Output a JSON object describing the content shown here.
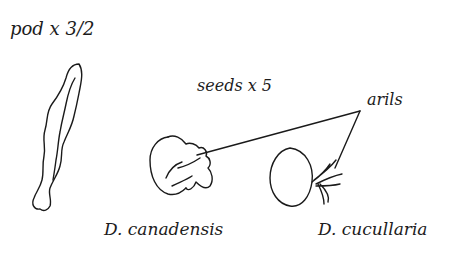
{
  "labels": {
    "pod_scale": "pod x 3/2",
    "seeds_scale": "seeds x 5",
    "arils": "arils",
    "species_left": "D. canadensis",
    "species_right": "D. cucullaria"
  },
  "figures": [
    {
      "name": "pod",
      "description": "elongated wavy seed pod drawing"
    },
    {
      "name": "seed-d-canadensis",
      "description": "kidney-shaped seed with fleshy aril"
    },
    {
      "name": "seed-d-cucullaria",
      "description": "round seed with finger-like aril"
    }
  ],
  "colors": {
    "ink": "#1a1a1a",
    "background": "#ffffff"
  }
}
